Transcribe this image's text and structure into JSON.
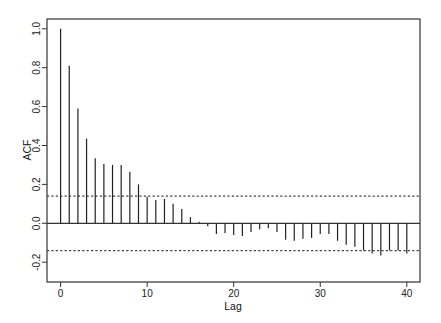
{
  "chart_data": {
    "type": "bar",
    "subtype": "acf-stem",
    "title": "",
    "xlabel": "Lag",
    "ylabel": "ACF",
    "xlim": [
      -1.5,
      41.5
    ],
    "ylim": [
      -0.3,
      1.05
    ],
    "xticks": [
      0,
      10,
      20,
      30,
      40
    ],
    "yticks": [
      -0.2,
      0.0,
      0.2,
      0.4,
      0.6,
      0.8,
      1.0
    ],
    "ytick_labels": [
      "-0.2",
      "0.0",
      "0.2",
      "0.4",
      "0.6",
      "0.8",
      "1.0"
    ],
    "xtick_labels": [
      "0",
      "10",
      "20",
      "30",
      "40"
    ],
    "grid": false,
    "legend": null,
    "confidence_band": {
      "upper": 0.14,
      "lower": -0.14,
      "style": "dotted"
    },
    "x": [
      0,
      1,
      2,
      3,
      4,
      5,
      6,
      7,
      8,
      9,
      10,
      11,
      12,
      13,
      14,
      15,
      16,
      17,
      18,
      19,
      20,
      21,
      22,
      23,
      24,
      25,
      26,
      27,
      28,
      29,
      30,
      31,
      32,
      33,
      34,
      35,
      36,
      37,
      38,
      39,
      40
    ],
    "values": [
      1.0,
      0.81,
      0.59,
      0.435,
      0.335,
      0.305,
      0.3,
      0.3,
      0.265,
      0.2,
      0.137,
      0.12,
      0.125,
      0.1,
      0.073,
      0.032,
      0.008,
      -0.015,
      -0.055,
      -0.05,
      -0.06,
      -0.065,
      -0.045,
      -0.03,
      -0.025,
      -0.045,
      -0.085,
      -0.09,
      -0.08,
      -0.075,
      -0.055,
      -0.055,
      -0.09,
      -0.11,
      -0.12,
      -0.14,
      -0.155,
      -0.165,
      -0.14,
      -0.14,
      -0.155
    ]
  },
  "colors": {
    "bars": "#222222",
    "axes": "#333333",
    "band": "#444444"
  }
}
